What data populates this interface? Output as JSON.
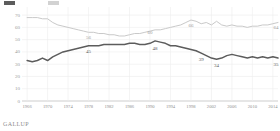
{
  "brand": {
    "name": "GALLUP"
  },
  "legend": {
    "items": [
      {
        "label": "",
        "color": "#5c5c5c",
        "name": "series-dark-swatch"
      },
      {
        "label": "",
        "color": "#c9c9c9",
        "name": "series-light-swatch"
      }
    ]
  },
  "chart_data": {
    "type": "line",
    "title": "",
    "subtitle": "",
    "xlabel": "",
    "ylabel": "",
    "grid": true,
    "legend_position": "top-left",
    "ylim": [
      0,
      75
    ],
    "yticks": [
      0,
      10,
      20,
      30,
      40,
      50,
      60,
      70
    ],
    "ytick_labels": [
      "0",
      "10",
      "20",
      "30",
      "40",
      "50",
      "60",
      "70"
    ],
    "xlim": [
      1965,
      2015
    ],
    "xticks": [
      1966,
      1970,
      1974,
      1978,
      1982,
      1986,
      1990,
      1994,
      1998,
      2002,
      2006,
      2010,
      2014
    ],
    "xtick_labels": [
      "1966",
      "1970",
      "1974",
      "1978",
      "1982",
      "1986",
      "1990",
      "1994",
      "1998",
      "2002",
      "2006",
      "2010",
      "2014"
    ],
    "x": [
      1966,
      1967,
      1968,
      1969,
      1970,
      1971,
      1972,
      1973,
      1974,
      1975,
      1976,
      1977,
      1978,
      1979,
      1980,
      1981,
      1982,
      1983,
      1984,
      1985,
      1986,
      1987,
      1988,
      1989,
      1990,
      1991,
      1992,
      1993,
      1994,
      1995,
      1996,
      1997,
      1998,
      1999,
      2000,
      2001,
      2002,
      2003,
      2004,
      2005,
      2006,
      2007,
      2008,
      2009,
      2010,
      2011,
      2012,
      2013,
      2014,
      2015
    ],
    "series": [
      {
        "name": "Light series",
        "color": "#c9c9c9",
        "values": [
          68,
          68,
          68,
          67,
          67,
          64,
          62,
          61,
          60,
          59,
          58,
          57,
          56,
          56,
          55,
          55,
          54,
          54,
          53,
          53,
          54,
          55,
          55,
          56,
          57,
          58,
          58,
          59,
          60,
          61,
          62,
          64,
          66,
          65,
          63,
          64,
          62,
          65,
          62,
          61,
          62,
          61,
          61,
          60,
          61,
          61,
          62,
          62,
          63,
          64
        ],
        "labels": [
          {
            "x": 1978,
            "value": 56
          },
          {
            "x": 1990,
            "value": 60
          },
          {
            "x": 1998,
            "value": 66
          },
          {
            "x": 2015,
            "value": 64
          }
        ]
      },
      {
        "name": "Dark series",
        "color": "#5c5c5c",
        "values": [
          33,
          32,
          33,
          35,
          33,
          36,
          38,
          40,
          41,
          42,
          43,
          44,
          45,
          45,
          45,
          46,
          46,
          46,
          46,
          46,
          47,
          47,
          46,
          46,
          47,
          49,
          48,
          47,
          45,
          45,
          44,
          43,
          42,
          41,
          39,
          37,
          35,
          34,
          35,
          37,
          38,
          37,
          36,
          35,
          36,
          35,
          36,
          35,
          36,
          35
        ],
        "labels": [
          {
            "x": 1978,
            "value": 45
          },
          {
            "x": 1991,
            "value": 48
          },
          {
            "x": 2000,
            "value": 39
          },
          {
            "x": 2003,
            "value": 34
          },
          {
            "x": 2015,
            "value": 35
          }
        ]
      }
    ]
  }
}
